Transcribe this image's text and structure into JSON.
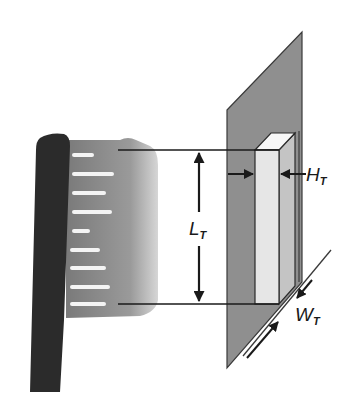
{
  "figure": {
    "colors": {
      "background": "#ffffff",
      "handle": "#2b2b2b",
      "bristles": "#8a8a8a",
      "bristle_highlight": "#f2f2f2",
      "bristle_tip_fade": "#c8c8c8",
      "plate": "#8f8f8f",
      "block_front": "#e6e6e6",
      "block_side": "#c4c4c4",
      "block_top": "#f7f7f7",
      "lines": "#1a1a1a"
    },
    "labels": {
      "length": {
        "symbol": "L",
        "subscript": "T"
      },
      "height": {
        "symbol": "H",
        "subscript": "T"
      },
      "width": {
        "symbol": "W",
        "subscript": "T"
      }
    }
  }
}
